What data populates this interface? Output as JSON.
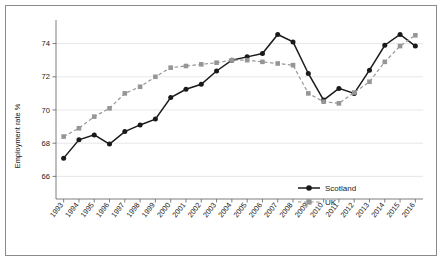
{
  "chart_data": {
    "type": "line",
    "title": "",
    "xlabel": "",
    "ylabel": "Employment rate %",
    "ylim": [
      65.0,
      75.3
    ],
    "yticks": [
      66,
      68,
      70,
      72,
      74
    ],
    "ytick_labels": [
      "66",
      "68",
      "70",
      "72",
      "74"
    ],
    "grid": true,
    "legend_position": "inside-lower-right",
    "categories": [
      "1993",
      "1994",
      "1995",
      "1996",
      "1997",
      "1998",
      "1999",
      "2000",
      "2001",
      "2002",
      "2003",
      "2004",
      "2005",
      "2006",
      "2007",
      "2008",
      "2009",
      "2010",
      "2011",
      "2012",
      "2013",
      "2014",
      "2015",
      "2016"
    ],
    "series": [
      {
        "name": "Scotland",
        "color": "#1a1a1a",
        "linestyle": "solid",
        "marker": "circle",
        "values": [
          67.1,
          68.2,
          68.5,
          67.95,
          68.7,
          69.1,
          69.45,
          70.75,
          71.25,
          71.55,
          72.35,
          73.0,
          73.2,
          73.4,
          74.55,
          74.1,
          72.2,
          70.6,
          71.3,
          71.0,
          72.4,
          73.9,
          74.55,
          73.85
        ]
      },
      {
        "name": "UK",
        "color": "#969696",
        "linestyle": "dashed",
        "marker": "square",
        "values": [
          68.4,
          68.9,
          69.6,
          70.1,
          71.0,
          71.4,
          72.0,
          72.55,
          72.65,
          72.75,
          72.85,
          73.0,
          73.0,
          72.9,
          72.8,
          72.7,
          71.0,
          70.5,
          70.4,
          71.05,
          71.7,
          72.9,
          73.85,
          74.5
        ]
      }
    ]
  },
  "legend": {
    "entries": [
      {
        "label": "Scotland"
      },
      {
        "label": "UK"
      }
    ]
  },
  "colors": {
    "scotland": "#1a1a1a",
    "uk": "#969696",
    "grid": "#dcdcdc",
    "axis": "#707070",
    "frame": "#8a8a8a"
  }
}
